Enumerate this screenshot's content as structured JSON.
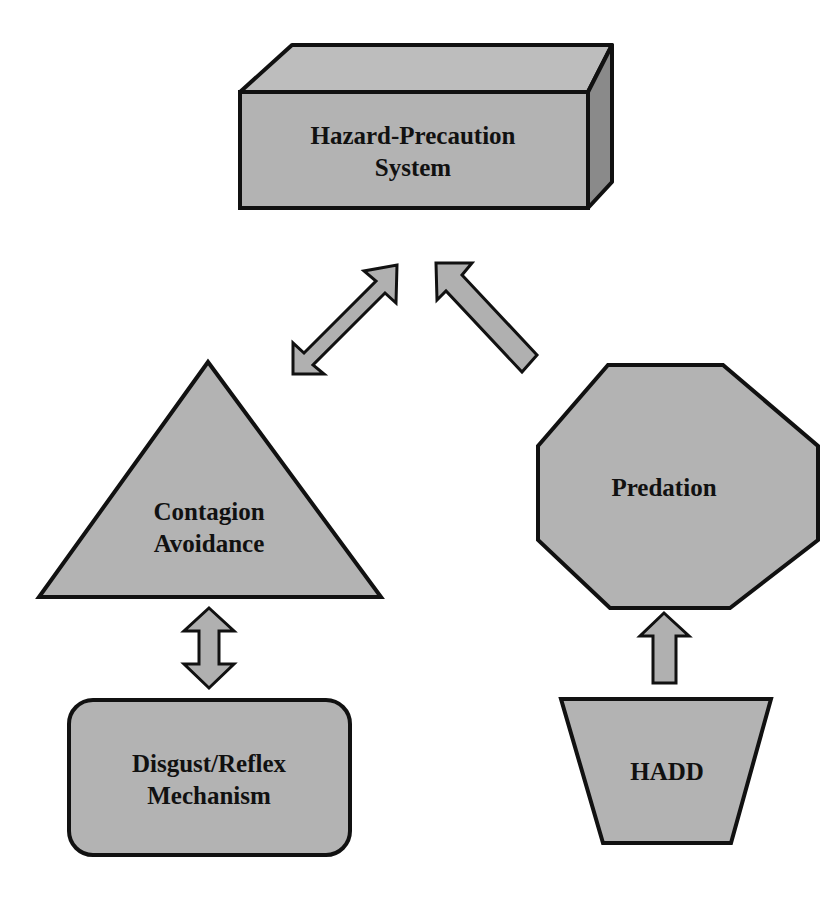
{
  "diagram": {
    "colors": {
      "fill": "#b4b4b4",
      "fill_dark": "#8c8c8c",
      "fill_top": "#bcbcbc",
      "stroke": "#111111",
      "background": "#ffffff"
    },
    "nodes": {
      "hazard_precaution": {
        "shape": "3d-box",
        "line1": "Hazard-Precaution",
        "line2": "System"
      },
      "contagion_avoidance": {
        "shape": "triangle",
        "line1": "Contagion",
        "line2": "Avoidance"
      },
      "predation": {
        "shape": "octagon",
        "line1": "Predation"
      },
      "disgust_reflex": {
        "shape": "rounded-rectangle",
        "line1": "Disgust/Reflex",
        "line2": "Mechanism"
      },
      "hadd": {
        "shape": "trapezoid",
        "line1": "HADD"
      }
    },
    "edges": [
      {
        "from": "contagion_avoidance",
        "to": "hazard_precaution",
        "type": "bidirectional-arrow"
      },
      {
        "from": "predation",
        "to": "hazard_precaution",
        "type": "arrow"
      },
      {
        "from": "contagion_avoidance",
        "to": "disgust_reflex",
        "type": "bidirectional-arrow"
      },
      {
        "from": "hadd",
        "to": "predation",
        "type": "arrow"
      }
    ]
  }
}
